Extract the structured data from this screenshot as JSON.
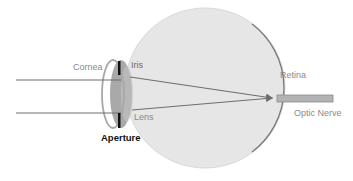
{
  "diagram": {
    "labels": {
      "cornea": "Cornea",
      "iris": "Iris",
      "lens": "Lens",
      "aperture": "Aperture",
      "retina": "Retina",
      "optic_nerve": "Optic Nerve"
    },
    "colors": {
      "eyeball_fill": "#e6e6e6",
      "eyeball_edge": "#d4d4d4",
      "retina_edge": "#7a7a7a",
      "lens_fill": "#9a9a9a",
      "cornea_stroke": "#a8a8a8",
      "iris": "#111111",
      "ray": "#6e6e6e",
      "optic_nerve_fill": "#b3b3b3",
      "optic_nerve_stroke": "#8a8a8a"
    },
    "rays": [
      {
        "name": "upper-ray",
        "start": [
          16,
          80
        ],
        "lens_point": [
          121,
          80
        ],
        "focus": [
          272,
          98
        ]
      },
      {
        "name": "lower-ray",
        "start": [
          16,
          113
        ],
        "lens_point": [
          121,
          113
        ],
        "focus": [
          272,
          98
        ]
      }
    ]
  }
}
